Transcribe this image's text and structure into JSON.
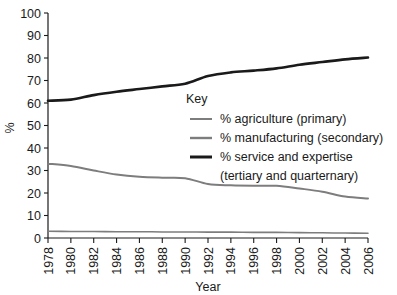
{
  "chart_data": {
    "type": "line",
    "title": "",
    "xlabel": "Year",
    "ylabel": "%",
    "xlim": [
      1978,
      2006
    ],
    "ylim": [
      0,
      100
    ],
    "grid": false,
    "legend_position": "center",
    "legend_title": "Key",
    "categories": [
      1978,
      1980,
      1982,
      1984,
      1986,
      1988,
      1990,
      1992,
      1994,
      1996,
      1998,
      2000,
      2002,
      2004,
      2006
    ],
    "x_tick_labels": [
      "1978",
      "1980",
      "1982",
      "1984",
      "1986",
      "1988",
      "1990",
      "1992",
      "1994",
      "1996",
      "1998",
      "2000",
      "2002",
      "2004",
      "2006"
    ],
    "y_tick_labels": [
      "0",
      "10",
      "20",
      "30",
      "40",
      "50",
      "60",
      "70",
      "80",
      "90",
      "100"
    ],
    "y_ticks": [
      0,
      10,
      20,
      30,
      40,
      50,
      60,
      70,
      80,
      90,
      100
    ],
    "series": [
      {
        "name": "% agriculture (primary)",
        "color": "#7d7d7d",
        "stroke_width": 1.6,
        "values": [
          3.0,
          2.9,
          2.9,
          2.8,
          2.8,
          2.7,
          2.7,
          2.6,
          2.6,
          2.5,
          2.5,
          2.4,
          2.3,
          2.2,
          2.1
        ]
      },
      {
        "name": "% manufacturing (secondary)",
        "color": "#7d7d7d",
        "stroke_width": 2.0,
        "values": [
          33.0,
          32.0,
          30.0,
          28.2,
          27.2,
          26.8,
          26.6,
          24.0,
          23.4,
          23.2,
          23.2,
          22.0,
          20.6,
          18.4,
          17.6
        ]
      },
      {
        "name": "% service and expertise (tertiary and quarternary)",
        "color": "#1a1a1a",
        "stroke_width": 2.6,
        "values": [
          61.0,
          61.5,
          63.5,
          65.0,
          66.2,
          67.4,
          68.6,
          72.0,
          73.6,
          74.4,
          75.4,
          77.0,
          78.2,
          79.4,
          80.2
        ]
      }
    ],
    "legend_entries": [
      {
        "label": "% agriculture (primary)",
        "label_line2": "",
        "color": "#7d7d7d",
        "swatch_width": 2.0
      },
      {
        "label": "% manufacturing (secondary)",
        "label_line2": "",
        "color": "#7d7d7d",
        "swatch_width": 2.4
      },
      {
        "label": "% service and expertise",
        "label_line2": "(tertiary and quarternary)",
        "color": "#1a1a1a",
        "swatch_width": 3.0
      }
    ]
  }
}
